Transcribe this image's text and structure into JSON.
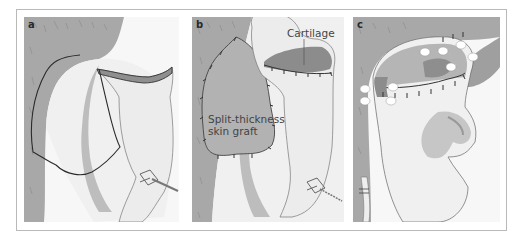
{
  "figure": {
    "panels": [
      {
        "id": "a",
        "label": "a"
      },
      {
        "id": "b",
        "label": "b"
      },
      {
        "id": "c",
        "label": "c"
      }
    ],
    "annotations": {
      "cartilage": "Cartilage",
      "graft_line1": "Split-thickness",
      "graft_line2": "skin graft"
    },
    "colors": {
      "frame": "#b9b9b9",
      "hair_gray": "#a9a9a9",
      "skin_light": "#f2f2f2",
      "shade": "#c4c4c4",
      "dark_shade": "#8f8f8f",
      "suture": "#333333",
      "outline": "#555555"
    }
  }
}
